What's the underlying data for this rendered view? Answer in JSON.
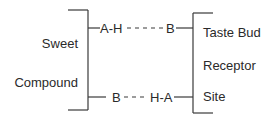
{
  "diagram": {
    "left_group": {
      "label_line1": "Sweet",
      "label_line2": "Compound"
    },
    "right_group": {
      "label_line1": "Taste Bud",
      "label_line2": "Receptor",
      "label_line3": "Site"
    },
    "top_interaction": {
      "donor": "A-H",
      "acceptor": "B"
    },
    "bottom_interaction": {
      "acceptor": "B",
      "donor": "H-A"
    },
    "colors": {
      "line": "#3a3a3a",
      "text": "#2a2a2a",
      "background": "#ffffff"
    }
  }
}
